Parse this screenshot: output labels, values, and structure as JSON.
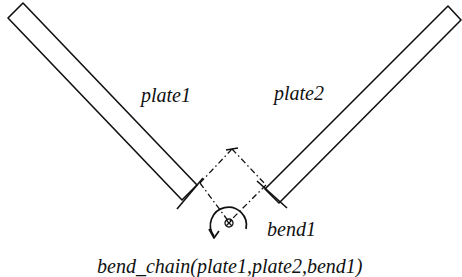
{
  "diagram": {
    "labels": {
      "plate1": "plate1",
      "plate2": "plate2",
      "bend1": "bend1"
    },
    "caption": "bend_chain(plate1,plate2,bend1)",
    "elements": [
      {
        "id": "plate1",
        "type": "rectangular plate",
        "orientation": "diagonal down-right"
      },
      {
        "id": "plate2",
        "type": "rectangular plate",
        "orientation": "diagonal down-left"
      },
      {
        "id": "bend1",
        "type": "bend",
        "symbol": "rotation axis (circled cross) with curved arrow",
        "construction_lines": "dash-dot"
      }
    ],
    "colors": {
      "line": "#111111",
      "background": "#ffffff"
    }
  }
}
